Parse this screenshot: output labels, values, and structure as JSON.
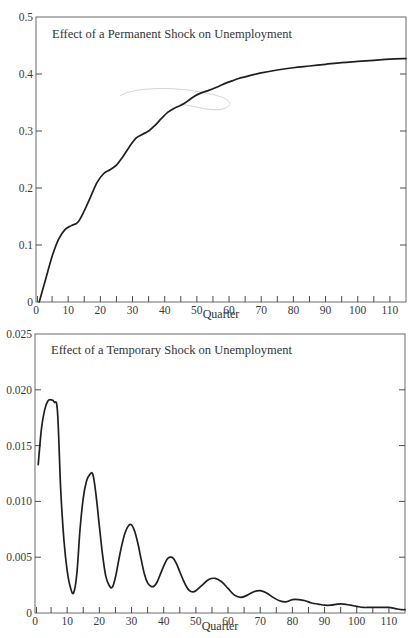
{
  "chart_data": [
    {
      "type": "line",
      "title": "Effect of a Permanent Shock on Unemployment",
      "xlabel": "Quarter",
      "ylabel": "",
      "xlim": [
        0,
        115
      ],
      "ylim": [
        0,
        0.5
      ],
      "x_ticks": [
        0,
        10,
        20,
        30,
        40,
        50,
        60,
        70,
        80,
        90,
        100,
        110
      ],
      "x_minor_ticks": [
        5,
        15,
        25,
        35,
        45,
        55,
        65,
        75,
        85,
        95,
        105
      ],
      "y_ticks": [
        0,
        0.1,
        0.2,
        0.3,
        0.4,
        0.5
      ],
      "y_tick_labels": [
        "0",
        "0.1",
        "0.2",
        "0.3",
        "0.4",
        "0.5"
      ],
      "grid": false,
      "legend": null,
      "series": [
        {
          "name": "Permanent shock",
          "x": [
            1,
            3,
            5,
            7,
            9,
            11,
            13,
            15,
            17,
            19,
            21,
            23,
            25,
            27,
            29,
            31,
            33,
            35,
            37,
            39,
            41,
            43,
            45,
            47,
            49,
            51,
            53,
            55,
            57,
            59,
            61,
            63,
            65,
            67,
            70,
            75,
            80,
            85,
            90,
            95,
            100,
            105,
            110,
            115
          ],
          "values": [
            0.0,
            0.04,
            0.08,
            0.11,
            0.127,
            0.134,
            0.14,
            0.16,
            0.185,
            0.21,
            0.225,
            0.232,
            0.24,
            0.255,
            0.272,
            0.287,
            0.294,
            0.3,
            0.31,
            0.322,
            0.333,
            0.34,
            0.345,
            0.352,
            0.36,
            0.366,
            0.37,
            0.374,
            0.379,
            0.384,
            0.388,
            0.392,
            0.395,
            0.398,
            0.402,
            0.407,
            0.411,
            0.414,
            0.417,
            0.42,
            0.422,
            0.424,
            0.426,
            0.427
          ]
        }
      ]
    },
    {
      "type": "line",
      "title": "Effect of a Temporary Shock on Unemployment",
      "xlabel": "Quarter",
      "ylabel": "",
      "xlim": [
        0,
        115
      ],
      "ylim": [
        0,
        0.025
      ],
      "x_ticks": [
        0,
        10,
        20,
        30,
        40,
        50,
        60,
        70,
        80,
        90,
        100,
        110
      ],
      "x_minor_ticks": [
        5,
        15,
        25,
        35,
        45,
        55,
        65,
        75,
        85,
        95,
        105
      ],
      "y_ticks": [
        0,
        0.005,
        0.01,
        0.015,
        0.02,
        0.025
      ],
      "y_tick_labels": [
        "0",
        "0.005",
        "0.010",
        "0.015",
        "0.020",
        "0.025"
      ],
      "grid": false,
      "legend": null,
      "series": [
        {
          "name": "Temporary shock",
          "x": [
            1,
            2,
            3,
            4,
            5,
            6,
            7,
            8,
            9,
            10,
            11,
            12,
            13,
            14,
            15,
            16,
            17,
            18,
            19,
            20,
            21,
            22,
            23,
            24,
            25,
            26,
            27,
            28,
            29,
            30,
            31,
            32,
            33,
            34,
            35,
            36,
            37,
            38,
            39,
            40,
            41,
            42,
            43,
            44,
            45,
            46,
            47,
            48,
            49,
            50,
            52,
            54,
            56,
            58,
            60,
            62,
            64,
            66,
            68,
            70,
            72,
            74,
            76,
            78,
            80,
            82,
            84,
            86,
            88,
            90,
            92,
            94,
            96,
            98,
            100,
            102,
            104,
            106,
            108,
            110,
            112,
            114,
            115
          ],
          "values": [
            0.0133,
            0.0165,
            0.0182,
            0.019,
            0.0191,
            0.0189,
            0.018,
            0.011,
            0.0065,
            0.0038,
            0.0023,
            0.0018,
            0.0035,
            0.0075,
            0.0103,
            0.0118,
            0.0124,
            0.0124,
            0.0105,
            0.0078,
            0.0052,
            0.0033,
            0.0025,
            0.0023,
            0.0032,
            0.0047,
            0.0061,
            0.0072,
            0.0078,
            0.0079,
            0.0073,
            0.0062,
            0.0048,
            0.0035,
            0.0027,
            0.0024,
            0.0024,
            0.0028,
            0.0035,
            0.0042,
            0.0048,
            0.005,
            0.0049,
            0.0044,
            0.0037,
            0.003,
            0.0024,
            0.002,
            0.0019,
            0.002,
            0.0025,
            0.003,
            0.0031,
            0.0028,
            0.0022,
            0.0016,
            0.0014,
            0.0016,
            0.0019,
            0.002,
            0.0018,
            0.0014,
            0.0011,
            0.001,
            0.0012,
            0.0012,
            0.0011,
            0.0009,
            0.0008,
            0.0007,
            0.0007,
            0.0008,
            0.0008,
            0.0007,
            0.0006,
            0.0005,
            0.0005,
            0.0005,
            0.0005,
            0.0005,
            0.0004,
            0.0003,
            0.0003
          ]
        }
      ]
    }
  ],
  "charts": {
    "top": {
      "title": "Effect of a Permanent Shock on Unemployment",
      "xlabel": "Quarter",
      "y_labels": [
        "0",
        "0.1",
        "0.2",
        "0.3",
        "0.4",
        "0.5"
      ],
      "x_labels": [
        "0",
        "10",
        "20",
        "30",
        "40",
        "50",
        "60",
        "70",
        "80",
        "90",
        "100",
        "110"
      ]
    },
    "bottom": {
      "title": "Effect of a Temporary Shock on Unemployment",
      "xlabel": "Quarter",
      "y_labels": [
        "0",
        "0.005",
        "0.010",
        "0.015",
        "0.020",
        "0.025"
      ],
      "x_labels": [
        "0",
        "10",
        "20",
        "30",
        "40",
        "50",
        "60",
        "70",
        "80",
        "90",
        "100",
        "110"
      ]
    }
  },
  "colors": {
    "line": "#1f1f1f",
    "axis": "#6a6a6a",
    "text": "#333333",
    "background": "#ffffff"
  }
}
